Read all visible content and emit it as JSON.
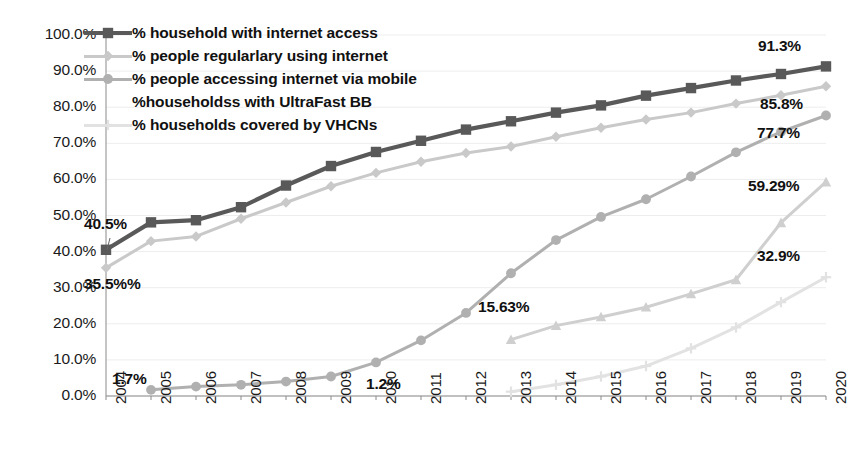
{
  "chart_data": {
    "type": "line",
    "title": "",
    "xlabel": "",
    "ylabel": "",
    "ylim": [
      0,
      100
    ],
    "ytick_labels": [
      "100.0%",
      "90.0%",
      "80.0%",
      "70.0%",
      "60.0%",
      "50.0%",
      "40.0%",
      "30.0%",
      "20.0%",
      "10.0%",
      "0.0%"
    ],
    "ytick_values": [
      100,
      90,
      80,
      70,
      60,
      50,
      40,
      30,
      20,
      10,
      0
    ],
    "grid": true,
    "legend_position": "top-left",
    "categories": [
      "2004",
      "2005",
      "2006",
      "2007",
      "2008",
      "2009",
      "2010",
      "2011",
      "2012",
      "2013",
      "2014",
      "2015",
      "2016",
      "2017",
      "2018",
      "2019",
      "2020"
    ],
    "series": [
      {
        "name": "% household with internet access",
        "color": "#595959",
        "marker": "square",
        "values": [
          40.5,
          48.1,
          48.7,
          52.3,
          58.3,
          63.7,
          67.6,
          70.7,
          73.8,
          76.1,
          78.5,
          80.5,
          83.2,
          85.3,
          87.4,
          89.2,
          91.3
        ]
      },
      {
        "name": "% people regularlary using internet",
        "color": "#c9c9c9",
        "marker": "diamond",
        "values": [
          35.5,
          42.9,
          44.2,
          49.1,
          53.6,
          58.1,
          61.8,
          64.9,
          67.3,
          69.1,
          71.8,
          74.3,
          76.6,
          78.5,
          81.0,
          83.3,
          85.8
        ]
      },
      {
        "name": "% people accessing internet via mobile",
        "color": "#b0b0b0",
        "marker": "circle",
        "values": [
          null,
          1.7,
          2.6,
          3.1,
          4.0,
          5.4,
          9.3,
          15.4,
          23.0,
          34.0,
          43.2,
          49.6,
          54.5,
          60.8,
          67.5,
          73.2,
          77.7
        ]
      },
      {
        "name": "%householdss with  UltraFast BB",
        "color": "#cfcfcf",
        "marker": "triangle",
        "values": [
          null,
          null,
          null,
          null,
          null,
          null,
          null,
          null,
          null,
          15.63,
          19.5,
          21.9,
          24.6,
          28.3,
          32.2,
          48.0,
          59.29
        ]
      },
      {
        "name": "% households covered by VHCNs",
        "color": "#e2e2e2",
        "marker": "cross",
        "values": [
          null,
          null,
          null,
          null,
          null,
          null,
          null,
          null,
          null,
          1.2,
          3.1,
          5.4,
          8.3,
          13.2,
          19.0,
          26.0,
          32.9
        ]
      }
    ],
    "annotations": [
      {
        "text": "40.5%",
        "year": "2004",
        "value": 40.5,
        "placement": "left-above"
      },
      {
        "text": "35.5%%",
        "year": "2004",
        "value": 35.5,
        "placement": "left-below"
      },
      {
        "text": "1.7%",
        "year": "2005",
        "value": 1.7,
        "placement": "left-above"
      },
      {
        "text": "1.2%",
        "year": "2013",
        "value": 1.2,
        "placement": "left-above"
      },
      {
        "text": "15.63%",
        "year": "2013",
        "value": 15.63,
        "placement": "right-above"
      },
      {
        "text": "91.3%",
        "year": "2020",
        "value": 91.3,
        "placement": "right-above"
      },
      {
        "text": "85.8%",
        "year": "2020",
        "value": 85.8,
        "placement": "right-below"
      },
      {
        "text": "77.7%",
        "year": "2020",
        "value": 77.7,
        "placement": "right-below"
      },
      {
        "text": "59.29%",
        "year": "2020",
        "value": 59.29,
        "placement": "right-above"
      },
      {
        "text": "32.9%",
        "year": "2020",
        "value": 32.9,
        "placement": "right-above"
      }
    ]
  }
}
